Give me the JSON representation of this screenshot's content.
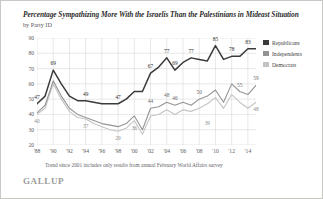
{
  "header": {
    "title": "Percentage Sympathizing More With the Israelis Than the Palestinians in Mideast Situation",
    "subtitle": "by Party ID"
  },
  "footnote": "Trend since 2001 includes only results from annual February World Affairs survey",
  "brand": "GALLUP",
  "colors": {
    "republicans": "#3b3b3b",
    "independents": "#949494",
    "democrats": "#c4c4c4",
    "grid": "#d8d8d6",
    "axis_text": "#5c5b60",
    "border": "#c8c8c4"
  },
  "legend": {
    "position": "right",
    "entries": [
      {
        "label": "Republicans",
        "color": "#3b3b3b"
      },
      {
        "label": "Independents",
        "color": "#949494"
      },
      {
        "label": "Democrats",
        "color": "#c4c4c4"
      }
    ]
  },
  "chart_data": {
    "type": "line",
    "title": "Percentage Sympathizing More With the Israelis Than the Palestinians in Mideast Situation",
    "subtitle": "by Party ID",
    "xlabel": "",
    "ylabel": "",
    "ylim": [
      20,
      90
    ],
    "yticks": [
      20,
      30,
      40,
      50,
      60,
      70,
      80,
      90
    ],
    "ytick_labels": [
      "20",
      "30",
      "40",
      "50",
      "60",
      "70",
      "80",
      "90"
    ],
    "grid": true,
    "x": [
      1988,
      1989,
      1990,
      1991,
      1992,
      1993,
      1994,
      1995,
      1996,
      1997,
      1998,
      1999,
      2000,
      2001,
      2002,
      2003,
      2004,
      2005,
      2006,
      2007,
      2008,
      2009,
      2010,
      2011,
      2012,
      2013,
      2014,
      2015
    ],
    "xtick_values": [
      1988,
      1990,
      1992,
      1994,
      1996,
      1998,
      2000,
      2002,
      2004,
      2006,
      2008,
      2010,
      2012,
      2014
    ],
    "xtick_labels": [
      "'88",
      "'90",
      "'92",
      "'94",
      "'96",
      "'98",
      "'00",
      "'02",
      "'04",
      "'06",
      "'08",
      "'10",
      "'12",
      "'14"
    ],
    "series": [
      {
        "name": "Republicans",
        "color": "#3b3b3b",
        "values": [
          47,
          52,
          69,
          60,
          52,
          49,
          49,
          48,
          47,
          47,
          47,
          50,
          55,
          55,
          67,
          71,
          77,
          69,
          74,
          77,
          76,
          75,
          85,
          76,
          78,
          78,
          83,
          83
        ],
        "labels": [
          {
            "x": 1988,
            "y": 47,
            "text": "47"
          },
          {
            "x": 1990,
            "y": 69,
            "text": "69"
          },
          {
            "x": 1994,
            "y": 49,
            "text": "49"
          },
          {
            "x": 1998,
            "y": 47,
            "text": "47"
          },
          {
            "x": 2002,
            "y": 67,
            "text": "67"
          },
          {
            "x": 2004,
            "y": 77,
            "text": "77"
          },
          {
            "x": 2005,
            "y": 69,
            "text": "69"
          },
          {
            "x": 2007,
            "y": 77,
            "text": "77"
          },
          {
            "x": 2010,
            "y": 85,
            "text": "85"
          },
          {
            "x": 2012,
            "y": 78,
            "text": "78"
          },
          {
            "x": 2014,
            "y": 83,
            "text": "83"
          }
        ]
      },
      {
        "name": "Independents",
        "color": "#949494",
        "values": [
          41,
          46,
          62,
          52,
          44,
          40,
          38,
          36,
          34,
          33,
          32,
          34,
          39,
          30,
          44,
          45,
          48,
          46,
          48,
          46,
          50,
          52,
          56,
          48,
          60,
          55,
          53,
          59
        ],
        "labels": [
          {
            "x": 2002,
            "y": 44,
            "text": "44"
          },
          {
            "x": 2004,
            "y": 48,
            "text": "48"
          },
          {
            "x": 2005,
            "y": 46,
            "text": "46"
          },
          {
            "x": 2008,
            "y": 50,
            "text": "50"
          },
          {
            "x": 2013,
            "y": 55,
            "text": "55"
          },
          {
            "x": 2015,
            "y": 59,
            "text": "59"
          }
        ]
      },
      {
        "name": "Democrats",
        "color": "#c4c4c4",
        "values": [
          40,
          44,
          60,
          50,
          42,
          38,
          37,
          34,
          32,
          30,
          29,
          31,
          36,
          27,
          39,
          40,
          43,
          40,
          43,
          42,
          44,
          47,
          51,
          44,
          53,
          48,
          44,
          48
        ],
        "labels": [
          {
            "x": 1988,
            "y": 40,
            "text": "40"
          },
          {
            "x": 1994,
            "y": 37,
            "text": "37"
          },
          {
            "x": 1998,
            "y": 29,
            "text": "29"
          },
          {
            "x": 2000,
            "y": 36,
            "text": "36"
          },
          {
            "x": 2009,
            "y": 39,
            "text": "39"
          },
          {
            "x": 2015,
            "y": 48,
            "text": "48"
          }
        ]
      }
    ]
  }
}
